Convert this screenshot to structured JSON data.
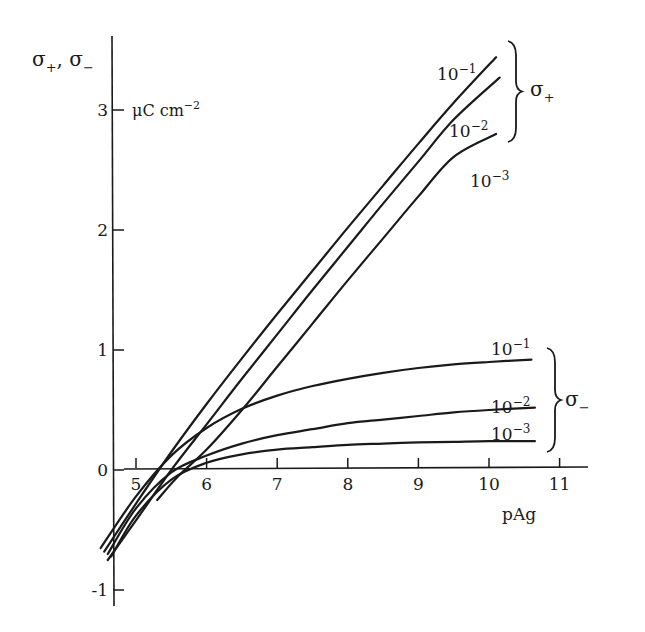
{
  "chart_data": {
    "type": "line",
    "title": "",
    "xlabel": "pAg",
    "ylabel": "σ+, σ−",
    "yunit": "μC cm−2",
    "xlim": [
      4.5,
      11.8
    ],
    "ylim": [
      -1.2,
      3.5
    ],
    "grid": false,
    "x_ticks": [
      5,
      6,
      7,
      8,
      9,
      10,
      11
    ],
    "y_ticks": [
      -1,
      0,
      1,
      2,
      3
    ],
    "groups": [
      {
        "name": "σ+",
        "brace_label_main": "σ",
        "brace_label_sub": "+"
      },
      {
        "name": "σ−",
        "brace_label_main": "σ",
        "brace_label_sub": "−"
      }
    ],
    "series": [
      {
        "name": "σ+ 10⁻¹",
        "group": "σ+",
        "label_base": "10",
        "label_exp": "−1",
        "x": [
          4.55,
          5.0,
          5.5,
          6.0,
          6.5,
          7.0,
          7.5,
          8.0,
          8.5,
          9.0,
          9.5,
          10.1
        ],
        "y": [
          -0.68,
          -0.28,
          0.15,
          0.55,
          0.93,
          1.3,
          1.66,
          2.02,
          2.37,
          2.72,
          3.06,
          3.44
        ]
      },
      {
        "name": "σ+ 10⁻²",
        "group": "σ+",
        "label_base": "10",
        "label_exp": "−2",
        "x": [
          4.6,
          5.0,
          5.5,
          6.0,
          6.5,
          7.0,
          7.5,
          8.0,
          8.5,
          9.0,
          9.5,
          10.15
        ],
        "y": [
          -0.75,
          -0.42,
          0.0,
          0.38,
          0.76,
          1.13,
          1.5,
          1.86,
          2.22,
          2.57,
          2.92,
          3.27
        ]
      },
      {
        "name": "σ+ 10⁻³",
        "group": "σ+",
        "label_base": "10",
        "label_exp": "−3",
        "x": [
          5.3,
          5.6,
          6.0,
          6.5,
          7.0,
          7.5,
          8.0,
          8.5,
          9.0,
          9.5,
          10.1
        ],
        "y": [
          -0.25,
          -0.05,
          0.17,
          0.5,
          0.86,
          1.22,
          1.58,
          1.93,
          2.28,
          2.61,
          2.8
        ]
      },
      {
        "name": "σ− 10⁻¹",
        "group": "σ−",
        "label_base": "10",
        "label_exp": "−1",
        "x": [
          4.5,
          5.0,
          5.5,
          6.0,
          6.5,
          7.0,
          7.5,
          8.0,
          8.5,
          9.0,
          9.5,
          10.0,
          10.6
        ],
        "y": [
          -0.65,
          -0.22,
          0.12,
          0.35,
          0.51,
          0.62,
          0.7,
          0.76,
          0.81,
          0.85,
          0.88,
          0.9,
          0.92
        ]
      },
      {
        "name": "σ− 10⁻²",
        "group": "σ−",
        "label_base": "10",
        "label_exp": "−2",
        "x": [
          4.6,
          5.0,
          5.5,
          6.0,
          6.5,
          7.0,
          7.5,
          8.0,
          8.5,
          9.0,
          9.5,
          10.0,
          10.65
        ],
        "y": [
          -0.7,
          -0.32,
          -0.02,
          0.12,
          0.22,
          0.29,
          0.34,
          0.39,
          0.42,
          0.45,
          0.48,
          0.5,
          0.52
        ]
      },
      {
        "name": "σ− 10⁻³",
        "group": "σ−",
        "label_base": "10",
        "label_exp": "−3",
        "x": [
          4.65,
          5.0,
          5.5,
          6.0,
          6.5,
          7.0,
          7.5,
          8.0,
          8.5,
          9.0,
          9.5,
          10.0,
          10.65
        ],
        "y": [
          -0.72,
          -0.38,
          -0.08,
          0.06,
          0.13,
          0.17,
          0.19,
          0.21,
          0.22,
          0.23,
          0.235,
          0.24,
          0.24
        ]
      }
    ]
  },
  "axes": {
    "y_title_main": "σ",
    "y_title_sub1": "+",
    "y_title_sep": ", ",
    "y_title_sub2": "−",
    "y_unit_base": "μC cm",
    "y_unit_exp": "−2",
    "x_title": "pAg"
  },
  "colors": {
    "ink": "#1a1a1a",
    "background": "#ffffff"
  }
}
